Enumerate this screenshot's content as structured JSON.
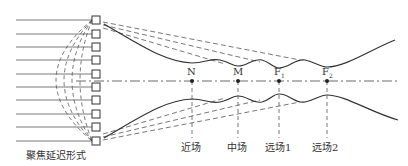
{
  "diagram": {
    "caption": "聚焦延迟形式",
    "elements_count": 10,
    "points": [
      {
        "label": "N",
        "x": 192,
        "field": "近场"
      },
      {
        "label": "M",
        "x": 238,
        "field": "中场"
      },
      {
        "label": "F1",
        "x": 279,
        "field": "远场1"
      },
      {
        "label": "F2",
        "x": 327,
        "field": "远场2"
      }
    ],
    "colors": {
      "line": "#333333",
      "dash": "#555555"
    }
  }
}
